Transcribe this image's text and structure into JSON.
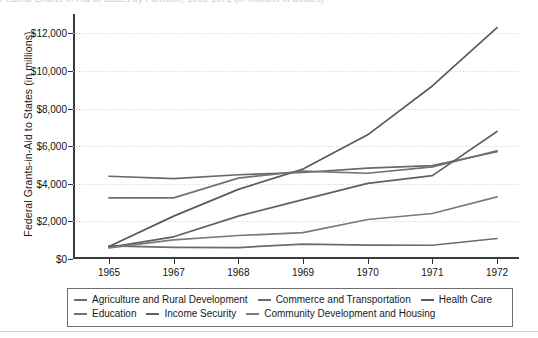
{
  "page": {
    "top_cropped_text": "Federal Grants-in-Aid to States by Function, 1965-1972 (in millions of dollars)"
  },
  "chart_data": {
    "type": "line",
    "title": "",
    "xlabel": "",
    "ylabel": "Federal Grants-in-Aid to States (in millions)",
    "categories": [
      "1965",
      "1967",
      "1968",
      "1969",
      "1970",
      "1971",
      "1972"
    ],
    "x": [
      1965,
      1967,
      1968,
      1969,
      1970,
      1971,
      1972
    ],
    "ylim": [
      0,
      12600
    ],
    "yticks": [
      0,
      2000,
      4000,
      6000,
      8000,
      10000,
      12000
    ],
    "ytick_labels": [
      "$0",
      "$2,000",
      "$4,000",
      "$6,000",
      "$8,000",
      "$10,000",
      "$12,000"
    ],
    "grid": "horizontal-dotted",
    "legend_position": "bottom",
    "series": [
      {
        "name": "Agriculture and Rural Development",
        "color": "#6b6b6b",
        "values": [
          700,
          620,
          610,
          790,
          740,
          730,
          1090
        ]
      },
      {
        "name": "Commerce and Transportation",
        "color": "#696969",
        "values": [
          4400,
          4270,
          4480,
          4600,
          4830,
          4960,
          5700
        ]
      },
      {
        "name": "Health Care",
        "color": "#5a5a5a",
        "values": [
          660,
          2280,
          3700,
          4780,
          6600,
          9200,
          12300
        ]
      },
      {
        "name": "Education",
        "color": "#727272",
        "values": [
          3250,
          3250,
          4300,
          4670,
          4560,
          4900,
          5750
        ]
      },
      {
        "name": "Income Security",
        "color": "#606060",
        "values": [
          620,
          1180,
          2280,
          3160,
          4020,
          4430,
          6780
        ]
      },
      {
        "name": "Community Development and Housing",
        "color": "#7a7a7a",
        "values": [
          590,
          1020,
          1250,
          1400,
          2100,
          2420,
          3300
        ]
      }
    ]
  },
  "legend": {
    "row1": [
      "Agriculture and Rural Development",
      "Commerce and Transportation",
      "Health Care"
    ],
    "row2": [
      "Education",
      "Income Security",
      "Community Development and Housing"
    ]
  }
}
